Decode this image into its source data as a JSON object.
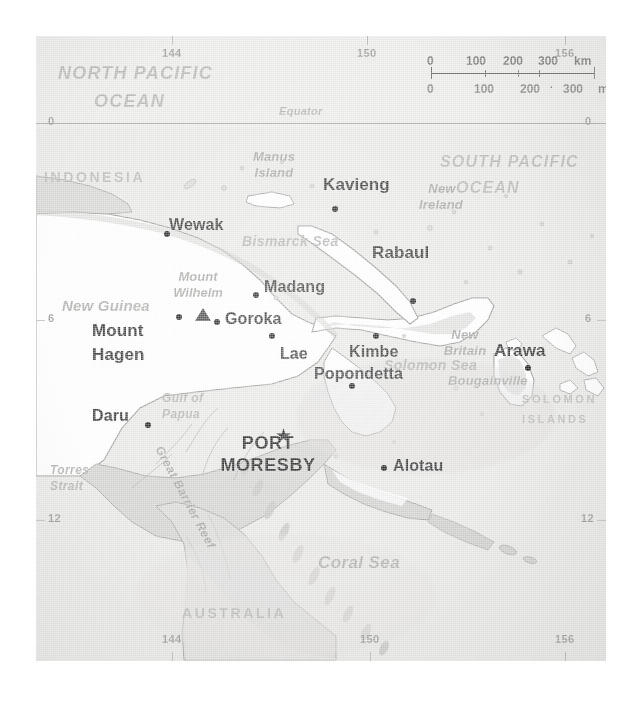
{
  "map": {
    "title": "Papua New Guinea reference map",
    "projection_note": "",
    "colors": {
      "sea": "#e9e9e7",
      "land_light": "#ffffff",
      "land_shaded": "#d6d6d4",
      "coast_line": "#9a9a98",
      "label_dark": "#3c3c3c",
      "label_light": "#b4b4b2",
      "marker": "#262626"
    },
    "scalebar": {
      "km_unit": "km",
      "mi_unit": "mi",
      "km_ticks": [
        "0",
        "100",
        "200",
        "300"
      ],
      "mi_ticks": [
        "0",
        "100",
        "200",
        "300"
      ]
    },
    "graticule": {
      "equator_label": "Equator",
      "top_longitudes": [
        {
          "label": "144",
          "x": 172
        },
        {
          "label": "150",
          "x": 367
        },
        {
          "label": "156",
          "x": 565
        }
      ],
      "bottom_longitudes": [
        {
          "label": "144",
          "x": 172
        },
        {
          "label": "150",
          "x": 370
        },
        {
          "label": "156",
          "x": 565
        }
      ],
      "left_latitudes": [
        {
          "label": "0",
          "y": 123
        },
        {
          "label": "6",
          "y": 320
        },
        {
          "label": "12",
          "y": 520
        }
      ],
      "right_latitudes": [
        {
          "label": "0",
          "y": 123
        },
        {
          "label": "6",
          "y": 320
        },
        {
          "label": "12",
          "y": 520
        }
      ]
    },
    "oceans": [
      {
        "id": "north-pacific",
        "line1": "NORTH PACIFIC",
        "line2": "OCEAN"
      },
      {
        "id": "south-pacific",
        "line1": "SOUTH PACIFIC",
        "line2": "OCEAN"
      }
    ],
    "seas": [
      {
        "id": "bismarck-sea",
        "label": "Bismarck Sea"
      },
      {
        "id": "solomon-sea",
        "label": "Solomon Sea"
      },
      {
        "id": "coral-sea",
        "label": "Coral Sea"
      },
      {
        "id": "gulf-of-papua",
        "line1": "Gulf of",
        "line2": "Papua"
      },
      {
        "id": "torres-strait",
        "line1": "Torres",
        "line2": "Strait"
      }
    ],
    "countries": [
      {
        "id": "indonesia",
        "label": "INDONESIA"
      },
      {
        "id": "australia",
        "label": "AUSTRALIA"
      },
      {
        "id": "solomon-islands",
        "line1": "SOLOMON",
        "line2": "ISLANDS"
      }
    ],
    "regions": [
      {
        "id": "new-guinea",
        "label": "New Guinea"
      },
      {
        "id": "new-ireland",
        "line1": "New",
        "line2": "Ireland"
      },
      {
        "id": "new-britain",
        "line1": "New",
        "line2": "Britain"
      },
      {
        "id": "bougainville",
        "label": "Bougainville"
      },
      {
        "id": "manus-island",
        "line1": "Manus",
        "line2": "Island"
      },
      {
        "id": "great-barrier-reef",
        "label": "Great Barrier Reef"
      }
    ],
    "peaks": [
      {
        "id": "mount-wilhelm",
        "line1": "Mount",
        "line2": "Wilhelm"
      }
    ],
    "capital": {
      "id": "port-moresby",
      "line1": "PORT",
      "line2": "MORESBY",
      "marker": "star"
    },
    "cities": [
      {
        "id": "wewak",
        "label": "Wewak"
      },
      {
        "id": "madang",
        "label": "Madang"
      },
      {
        "id": "goroka",
        "label": "Goroka"
      },
      {
        "id": "mount-hagen",
        "line1": "Mount",
        "line2": "Hagen"
      },
      {
        "id": "lae",
        "label": "Lae"
      },
      {
        "id": "daru",
        "label": "Daru"
      },
      {
        "id": "popondetta",
        "label": "Popondetta"
      },
      {
        "id": "alotau",
        "label": "Alotau"
      },
      {
        "id": "kavieng",
        "label": "Kavieng"
      },
      {
        "id": "rabaul",
        "label": "Rabaul"
      },
      {
        "id": "kimbe",
        "label": "Kimbe"
      },
      {
        "id": "arawa",
        "label": "Arawa"
      }
    ]
  }
}
